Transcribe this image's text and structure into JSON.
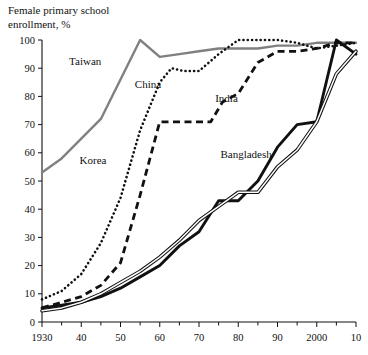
{
  "chart_data": {
    "type": "line",
    "title": "Female primary school enrollment, %",
    "title_lines": [
      "Female primary school",
      "enrollment, %"
    ],
    "xlabel": "",
    "ylabel": "",
    "xlim": [
      1930,
      2010
    ],
    "ylim": [
      0,
      100
    ],
    "grid": false,
    "legend_position": "inline-annotations",
    "xticks": [
      1930,
      1940,
      1950,
      1960,
      1970,
      1980,
      1990,
      2000,
      2010
    ],
    "xtick_labels": [
      "1930",
      "40",
      "50",
      "60",
      "70",
      "80",
      "90",
      "2000",
      "10"
    ],
    "yticks": [
      0,
      10,
      20,
      30,
      40,
      50,
      60,
      70,
      80,
      90,
      100
    ],
    "ytick_labels": [
      "0",
      "10",
      "20",
      "30",
      "40",
      "50",
      "60",
      "70",
      "80",
      "90",
      "100"
    ],
    "series": [
      {
        "name": "Taiwan",
        "style": "solid",
        "color": "#808080",
        "width": 2.4,
        "label_x": 1941,
        "label_y": 91,
        "x": [
          1930,
          1935,
          1940,
          1945,
          1950,
          1955,
          1960,
          1965,
          1970,
          1975,
          1980,
          1985,
          1990,
          1995,
          2000,
          2005,
          2010
        ],
        "y": [
          53,
          58,
          65,
          72,
          86,
          100,
          94,
          95,
          96,
          97,
          97,
          97,
          98,
          98,
          99,
          99,
          99
        ]
      },
      {
        "name": "Korea",
        "style": "dotted",
        "color": "#111111",
        "width": 2.6,
        "label_x": 1943,
        "label_y": 56,
        "x": [
          1930,
          1935,
          1940,
          1945,
          1950,
          1955,
          1960,
          1963,
          1966,
          1970,
          1975,
          1980,
          1985,
          1990,
          1995,
          2000,
          2005,
          2010
        ],
        "y": [
          8,
          11,
          17,
          28,
          44,
          68,
          85,
          90,
          89,
          89,
          95,
          100,
          100,
          100,
          99,
          97,
          98,
          99
        ]
      },
      {
        "name": "China",
        "style": "dashed",
        "color": "#111111",
        "width": 2.8,
        "label_x": 1957,
        "label_y": 83,
        "x": [
          1930,
          1935,
          1940,
          1945,
          1950,
          1955,
          1960,
          1965,
          1970,
          1973,
          1976,
          1980,
          1985,
          1990,
          1995,
          2000,
          2005,
          2010
        ],
        "y": [
          5,
          7,
          9,
          13,
          21,
          45,
          71,
          71,
          71,
          71,
          78,
          81,
          92,
          96,
          96,
          97,
          99,
          99
        ]
      },
      {
        "name": "India",
        "style": "solid",
        "color": "#111111",
        "width": 2.9,
        "label_x": 1977,
        "label_y": 78,
        "x": [
          1930,
          1935,
          1940,
          1945,
          1950,
          1955,
          1960,
          1965,
          1970,
          1975,
          1980,
          1985,
          1990,
          1995,
          2000,
          2005,
          2010
        ],
        "y": [
          5,
          6,
          7,
          9,
          12,
          16,
          20,
          27,
          32,
          43,
          43,
          50,
          62,
          70,
          71,
          100,
          95
        ]
      },
      {
        "name": "Bangladesh",
        "style": "double",
        "color": "#111111",
        "width": 1.1,
        "label_x": 1982,
        "label_y": 58,
        "x": [
          1930,
          1935,
          1940,
          1945,
          1950,
          1955,
          1960,
          1965,
          1970,
          1975,
          1980,
          1985,
          1990,
          1995,
          2000,
          2005,
          2010
        ],
        "y": [
          4,
          5,
          7,
          10,
          14,
          18,
          23,
          29,
          36,
          41,
          46,
          46,
          55,
          61,
          71,
          88,
          96
        ]
      }
    ]
  }
}
